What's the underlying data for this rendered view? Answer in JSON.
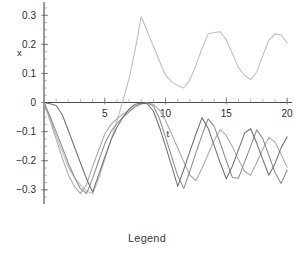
{
  "chart_data": {
    "type": "line",
    "title": "",
    "xlabel": "t",
    "ylabel": "x",
    "xlim": [
      0,
      20.4
    ],
    "ylim": [
      -0.335,
      0.325
    ],
    "grid": false,
    "legend_position": "bottom",
    "legend_caption": "Legend",
    "x_ticks": [
      5,
      10,
      15,
      20
    ],
    "x_tick_labels": [
      "5",
      "10",
      "15",
      "20"
    ],
    "x_minor_tick_step": 1,
    "y_ticks": [
      -0.3,
      -0.2,
      -0.1,
      0,
      0.1,
      0.2,
      0.3
    ],
    "y_tick_labels": [
      "−0.3",
      "−0.2",
      "−0.1",
      "0",
      "0.1",
      "0.2",
      "0.3"
    ],
    "y_minor_tick_step": 0.025,
    "axis_colors": {
      "axis": "#4a4a4a",
      "tick": "#6e6e6e",
      "minor_tick": "#9a9a9a",
      "text": "#2b2b2b"
    },
    "series": [
      {
        "name": "series-1",
        "color": "#bdbdbd",
        "x": [
          0,
          0.5,
          1,
          1.5,
          2,
          2.5,
          3,
          3.5,
          4,
          4.5,
          5,
          5.5,
          6,
          6.5,
          7,
          7.5,
          8,
          8.5,
          9,
          9.5,
          10,
          10.5,
          11,
          11.5,
          12,
          12.5,
          13,
          13.5,
          14,
          14.5,
          15,
          15.5,
          16,
          16.5,
          17,
          17.5,
          18,
          18.5,
          19,
          19.5,
          20
        ],
        "y": [
          0,
          -0.055,
          -0.112,
          -0.168,
          -0.222,
          -0.258,
          -0.283,
          -0.305,
          -0.313,
          -0.262,
          -0.196,
          -0.13,
          -0.064,
          0.008,
          0.082,
          0.182,
          0.295,
          0.244,
          0.193,
          0.142,
          0.094,
          0.072,
          0.058,
          0.05,
          0.078,
          0.128,
          0.186,
          0.236,
          0.241,
          0.243,
          0.215,
          0.168,
          0.12,
          0.093,
          0.079,
          0.105,
          0.162,
          0.214,
          0.236,
          0.232,
          0.205
        ]
      },
      {
        "name": "series-2",
        "color": "#a8a8a8",
        "x": [
          0,
          0.5,
          1,
          1.5,
          2,
          2.5,
          3,
          3.5,
          4,
          4.5,
          5,
          5.5,
          6,
          6.5,
          7,
          7.5,
          8,
          8.5,
          9,
          9.5,
          10,
          10.5,
          11,
          11.5,
          12,
          12.5,
          13,
          13.5,
          14,
          14.5,
          15,
          15.5,
          16,
          16.5,
          17,
          17.5,
          18,
          18.5,
          19,
          19.5,
          20
        ],
        "y": [
          0,
          -0.062,
          -0.126,
          -0.19,
          -0.248,
          -0.288,
          -0.313,
          -0.281,
          -0.22,
          -0.163,
          -0.108,
          -0.076,
          -0.056,
          -0.04,
          -0.026,
          -0.013,
          -0.005,
          -0.002,
          -0.006,
          -0.026,
          -0.062,
          -0.108,
          -0.156,
          -0.204,
          -0.25,
          -0.268,
          -0.226,
          -0.178,
          -0.13,
          -0.093,
          -0.113,
          -0.152,
          -0.197,
          -0.236,
          -0.25,
          -0.206,
          -0.16,
          -0.12,
          -0.136,
          -0.178,
          -0.222
        ]
      },
      {
        "name": "series-3",
        "color": "#8c8c8c",
        "x": [
          0,
          0.5,
          1,
          1.5,
          2,
          2.5,
          3,
          3.5,
          4,
          4.5,
          5,
          5.5,
          6,
          6.5,
          7,
          7.5,
          8,
          8.5,
          9,
          9.5,
          10,
          10.5,
          11,
          11.5,
          12,
          12.5,
          13,
          13.5,
          14,
          14.5,
          15,
          15.5,
          16,
          16.5,
          17,
          17.5,
          18,
          18.5,
          19,
          19.5,
          20
        ],
        "y": [
          0,
          -0.048,
          -0.1,
          -0.154,
          -0.208,
          -0.256,
          -0.296,
          -0.313,
          -0.26,
          -0.2,
          -0.142,
          -0.1,
          -0.072,
          -0.05,
          -0.032,
          -0.014,
          -0.004,
          -0.001,
          -0.012,
          -0.056,
          -0.12,
          -0.186,
          -0.252,
          -0.295,
          -0.236,
          -0.172,
          -0.112,
          -0.056,
          -0.082,
          -0.14,
          -0.2,
          -0.258,
          -0.26,
          -0.205,
          -0.15,
          -0.094,
          -0.124,
          -0.182,
          -0.24,
          -0.278,
          -0.232
        ]
      },
      {
        "name": "series-4",
        "color": "#6f6f6f",
        "x": [
          0,
          0.5,
          1,
          1.5,
          2,
          2.5,
          3,
          3.5,
          4,
          4.5,
          5,
          5.5,
          6,
          6.5,
          7,
          7.5,
          8,
          8.5,
          9,
          9.5,
          10,
          10.5,
          11,
          11.5,
          12,
          12.5,
          13,
          13.5,
          14,
          14.5,
          15,
          15.5,
          16,
          16.5,
          17,
          17.5,
          18,
          18.5,
          19,
          19.5,
          20
        ],
        "y": [
          0,
          -0.004,
          -0.01,
          -0.042,
          -0.096,
          -0.152,
          -0.208,
          -0.262,
          -0.308,
          -0.248,
          -0.188,
          -0.13,
          -0.085,
          -0.05,
          -0.022,
          -0.006,
          -0.002,
          -0.004,
          -0.03,
          -0.085,
          -0.15,
          -0.218,
          -0.288,
          -0.23,
          -0.168,
          -0.108,
          -0.052,
          -0.088,
          -0.148,
          -0.208,
          -0.262,
          -0.218,
          -0.162,
          -0.105,
          -0.09,
          -0.14,
          -0.196,
          -0.25,
          -0.21,
          -0.156,
          -0.118
        ]
      }
    ]
  }
}
